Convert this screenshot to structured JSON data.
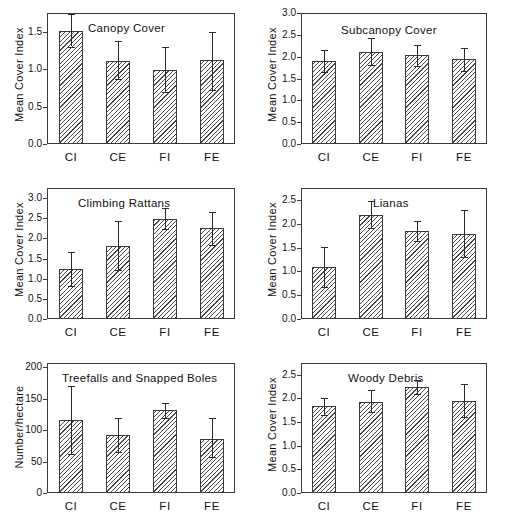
{
  "figure": {
    "title": "",
    "groups": [
      "CI",
      "CE",
      "FI",
      "FE"
    ]
  },
  "chart_data": [
    {
      "type": "bar",
      "title": "Canopy Cover",
      "xlabel": "",
      "ylabel": "Mean Cover Index",
      "categories": [
        "CI",
        "CE",
        "FI",
        "FE"
      ],
      "values": [
        1.51,
        1.11,
        0.99,
        1.12
      ],
      "errors_upper": [
        1.73,
        1.38,
        1.29,
        1.49
      ],
      "errors_lower": [
        1.3,
        0.87,
        0.7,
        0.72
      ],
      "ylim": [
        0.0,
        1.75
      ],
      "yticks": [
        0.0,
        0.5,
        1.0,
        1.5
      ],
      "ytick_labels": [
        "0.0",
        "0.5",
        "1.0",
        "1.5"
      ],
      "grid": false,
      "legend": "none"
    },
    {
      "type": "bar",
      "title": "Subcanopy Cover",
      "xlabel": "",
      "ylabel": "Mean Cover Index",
      "categories": [
        "CI",
        "CE",
        "FI",
        "FE"
      ],
      "values": [
        1.91,
        2.11,
        2.03,
        1.94
      ],
      "errors_upper": [
        2.16,
        2.42,
        2.27,
        2.2
      ],
      "errors_lower": [
        1.66,
        1.8,
        1.79,
        1.68
      ],
      "ylim": [
        0.0,
        3.0
      ],
      "yticks": [
        0.0,
        0.5,
        1.0,
        1.5,
        2.0,
        2.5,
        3.0
      ],
      "ytick_labels": [
        "0.0",
        "0.5",
        "1.0",
        "1.5",
        "2.0",
        "2.5",
        "3.0"
      ],
      "grid": false,
      "legend": "none"
    },
    {
      "type": "bar",
      "title": "Climbing Rattans",
      "xlabel": "",
      "ylabel": "Mean Cover Index",
      "categories": [
        "CI",
        "CE",
        "FI",
        "FE"
      ],
      "values": [
        1.23,
        1.82,
        2.49,
        2.25
      ],
      "errors_upper": [
        1.66,
        2.44,
        2.75,
        2.66
      ],
      "errors_lower": [
        0.82,
        1.21,
        2.23,
        1.84
      ],
      "ylim": [
        0.0,
        3.25
      ],
      "yticks": [
        0.0,
        0.5,
        1.0,
        1.5,
        2.0,
        2.5,
        3.0
      ],
      "ytick_labels": [
        "0.0",
        "0.5",
        "1.0",
        "1.5",
        "2.0",
        "2.5",
        "3.0"
      ],
      "grid": false,
      "legend": "none"
    },
    {
      "type": "bar",
      "title": "Lianas",
      "xlabel": "",
      "ylabel": "Mean Cover Index",
      "categories": [
        "CI",
        "CE",
        "FI",
        "FE"
      ],
      "values": [
        1.1,
        2.19,
        1.85,
        1.78
      ],
      "errors_upper": [
        1.52,
        2.47,
        2.05,
        2.28
      ],
      "errors_lower": [
        0.67,
        1.9,
        1.63,
        1.3
      ],
      "ylim": [
        0.0,
        2.75
      ],
      "yticks": [
        0.0,
        0.5,
        1.0,
        1.5,
        2.0,
        2.5
      ],
      "ytick_labels": [
        "0.0",
        "0.5",
        "1.0",
        "1.5",
        "2.0",
        "2.5"
      ],
      "grid": false,
      "legend": "none"
    },
    {
      "type": "bar",
      "title": "Treefalls and Snapped Boles",
      "xlabel": "",
      "ylabel": "Number/hectare",
      "categories": [
        "CI",
        "CE",
        "FI",
        "FE"
      ],
      "values": [
        117,
        93,
        132,
        86
      ],
      "errors_upper": [
        170,
        120,
        144,
        119
      ],
      "errors_lower": [
        62,
        66,
        119,
        57
      ],
      "ylim": [
        0,
        207
      ],
      "yticks": [
        0,
        50,
        100,
        150,
        200
      ],
      "ytick_labels": [
        "0",
        "50",
        "100",
        "150",
        "200"
      ],
      "grid": false,
      "legend": "none"
    },
    {
      "type": "bar",
      "title": "Woody Debris",
      "xlabel": "",
      "ylabel": "Mean Cover Index",
      "categories": [
        "CI",
        "CE",
        "FI",
        "FE"
      ],
      "values": [
        1.84,
        1.93,
        2.24,
        1.95
      ],
      "errors_upper": [
        2.0,
        2.17,
        2.38,
        2.31
      ],
      "errors_lower": [
        1.66,
        1.71,
        2.09,
        1.61
      ],
      "ylim": [
        0.0,
        2.75
      ],
      "yticks": [
        0.0,
        0.5,
        1.0,
        1.5,
        2.0,
        2.5
      ],
      "ytick_labels": [
        "0.0",
        "0.5",
        "1.0",
        "1.5",
        "2.0",
        "2.5"
      ],
      "grid": false,
      "legend": "none"
    }
  ]
}
